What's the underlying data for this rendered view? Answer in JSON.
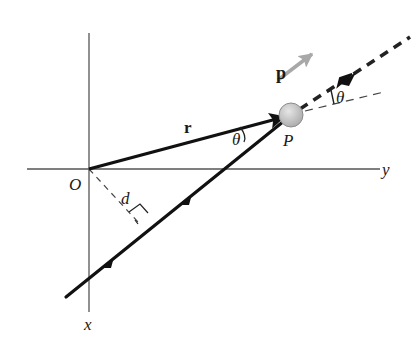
{
  "diagram": {
    "labels": {
      "origin": "O",
      "x_axis": "x",
      "y_axis": "y",
      "position_vector": "r",
      "momentum_vector": "p",
      "particle": "P",
      "perpendicular_distance": "d",
      "angle_at_particle": "θ",
      "angle_at_extension": "θ"
    },
    "colors": {
      "axis": "#555555",
      "vector": "#111111",
      "momentum": "#a8a8a8",
      "particle_fill": "#c4c4c4",
      "particle_stroke": "#8c8c8c",
      "dashed": "#444444"
    },
    "geometry": {
      "origin": [
        89,
        169
      ],
      "particle": [
        291,
        115
      ],
      "trajectory_start": [
        66,
        297
      ],
      "trajectory_end": [
        410,
        37
      ],
      "foot_of_perpendicular": [
        138,
        222
      ]
    }
  }
}
